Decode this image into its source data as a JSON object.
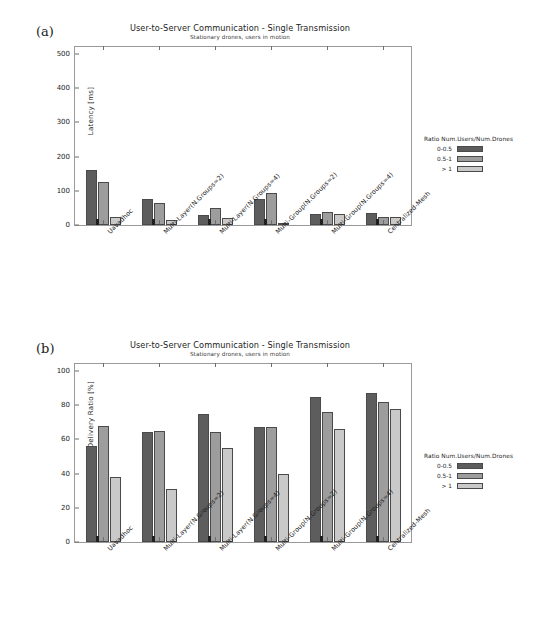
{
  "page_header": {
    "left": "",
    "right": ""
  },
  "figures": [
    {
      "panel_letter": "(a)",
      "title": "User-to-Server Communication - Single Transmission",
      "subtitle": "Stationary drones, users in motion",
      "legend": {
        "title": "Ratio Num.Users/Num.Drones",
        "entries": [
          "0-0.5",
          "0.5-1",
          "> 1"
        ]
      }
    },
    {
      "panel_letter": "(b)",
      "title": "User-to-Server Communication - Single Transmission",
      "subtitle": "Stationary drones, users in motion",
      "legend": {
        "title": "Ratio Num.Users/Num.Drones",
        "entries": [
          "0-0.5",
          "0.5-1",
          "> 1"
        ]
      }
    }
  ],
  "colors": {
    "series_0": "#5d5d5d",
    "series_1": "#9d9d9d",
    "series_2": "#c9c9c9",
    "axis": "#9a9a9a",
    "text": "#1d1d1d"
  },
  "chart_data": [
    {
      "type": "bar",
      "panel": "(a)",
      "title": "User-to-Server Communication - Single Transmission",
      "subtitle": "Stationary drones, users in motion",
      "xlabel": "",
      "ylabel": "Latency [ms]",
      "ylim": [
        0,
        520
      ],
      "yticks": [
        0,
        100,
        200,
        300,
        400,
        500
      ],
      "grid": false,
      "legend_position": "right-outside",
      "legend_title": "Ratio Num.Users/Num.Drones",
      "categories": [
        "Uavadhoc",
        "Multi-Layer(N.Groups=2)",
        "Multi-Layer(N.Groups=4)",
        "Multi-Group(N.Groups=2)",
        "Multi-Group(N.Groups=4)",
        "Centralized-Mesh"
      ],
      "series": [
        {
          "name": "0-0.5",
          "values": [
            160,
            76,
            28,
            76,
            33,
            35
          ]
        },
        {
          "name": "0.5-1",
          "values": [
            127,
            63,
            49,
            94,
            39,
            24
          ]
        },
        {
          "name": "> 1",
          "values": [
            22,
            16,
            20,
            7,
            32,
            24
          ]
        }
      ]
    },
    {
      "type": "bar",
      "panel": "(b)",
      "title": "User-to-Server Communication - Single Transmission",
      "subtitle": "Stationary drones, users in motion",
      "xlabel": "",
      "ylabel": "Packet Delivery Ratio [%]",
      "ylim": [
        0,
        104
      ],
      "yticks": [
        0,
        20,
        40,
        60,
        80,
        100
      ],
      "grid": false,
      "legend_position": "right-outside",
      "legend_title": "Ratio Num.Users/Num.Drones",
      "categories": [
        "Uavadhoc",
        "Multi-Layer(N.Groups=2)",
        "Multi-Layer(N.Groups=4)",
        "Multi-Group(N.Groups=2)",
        "Multi-Group(N.Groups=4)",
        "Centralized-Mesh"
      ],
      "series": [
        {
          "name": "0-0.5",
          "values": [
            56,
            64,
            75,
            67,
            85,
            87
          ]
        },
        {
          "name": "0.5-1",
          "values": [
            68,
            65,
            64,
            67,
            76,
            82
          ]
        },
        {
          "name": "> 1",
          "values": [
            38,
            31,
            55,
            40,
            66,
            78
          ]
        }
      ]
    }
  ]
}
